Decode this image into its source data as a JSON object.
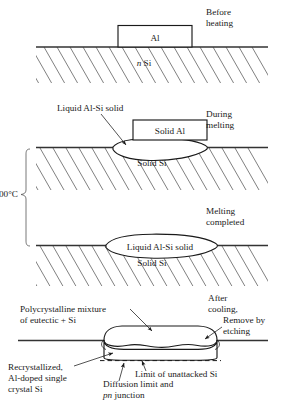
{
  "figure": {
    "colors": {
      "ink": "#1a1a1a",
      "surface_line": "#333333",
      "hatch": "#555555",
      "background": "#ffffff"
    }
  },
  "panel1": {
    "stage_label_line1": "Before",
    "stage_label_line2": "heating",
    "box_label": "Al",
    "substrate_italic": "n",
    "substrate_label": " Si"
  },
  "panel2": {
    "stage_label_line1": "During",
    "stage_label_line2": "melting",
    "callout_label": "Liquid Al-Si solid",
    "box_label": "Solid Al",
    "substrate_label": "Solid Si"
  },
  "panel3": {
    "stage_label_line1": "Melting",
    "stage_label_line2": "completed",
    "pool_label": "Liquid Al-Si solid",
    "substrate_label": "Solid Si",
    "temperature_label": "600°C"
  },
  "panel4": {
    "stage_label_line1": "After",
    "stage_label_line2": "cooling,",
    "remove_label_line1": "Remove by",
    "remove_label_line2": "etching",
    "poly_label_line1": "Polycrystalline mixture",
    "poly_label_line2": "of eutectic + Si",
    "recryst_label_line1": "Recrystallized,",
    "recryst_label_line2": "Al-doped single",
    "recryst_label_line3": "crystal Si",
    "diffusion_label_line1": "Diffusion limit and",
    "diffusion_label_italic": "pn",
    "diffusion_label_line2_rest": " junction",
    "limit_label": "Limit of unattacked Si"
  }
}
